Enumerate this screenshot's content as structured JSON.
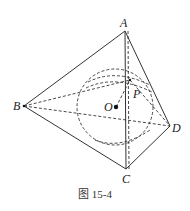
{
  "figure": {
    "caption": "图 15-4",
    "labels": {
      "A": "A",
      "B": "B",
      "C": "C",
      "D": "D",
      "O": "O",
      "P": "P"
    },
    "points": {
      "A": [
        125,
        31
      ],
      "B": [
        24,
        106
      ],
      "C": [
        126,
        169
      ],
      "D": [
        170,
        126
      ],
      "O": [
        116,
        107
      ],
      "P": [
        130,
        80
      ]
    },
    "colors": {
      "stroke": "#333333",
      "background": "#ffffff"
    }
  }
}
